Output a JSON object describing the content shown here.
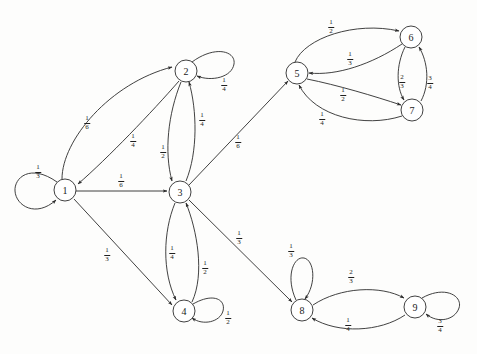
{
  "figure": {
    "type": "state-transition-diagram",
    "background_color": "#fdfdfc",
    "stroke_color": "#2b2b2b",
    "node_fill": "#ffffff",
    "width": 477,
    "height": 354
  },
  "nodes": [
    {
      "id": "1",
      "label": "1",
      "cx": 65,
      "cy": 190,
      "r": 11
    },
    {
      "id": "2",
      "label": "2",
      "cx": 186,
      "cy": 71,
      "r": 11
    },
    {
      "id": "3",
      "label": "3",
      "cx": 180,
      "cy": 192,
      "r": 11
    },
    {
      "id": "4",
      "label": "4",
      "cx": 184,
      "cy": 311,
      "r": 11
    },
    {
      "id": "5",
      "label": "5",
      "cx": 297,
      "cy": 73,
      "r": 11
    },
    {
      "id": "6",
      "label": "6",
      "cx": 411,
      "cy": 37,
      "r": 11
    },
    {
      "id": "7",
      "label": "7",
      "cx": 412,
      "cy": 110,
      "r": 11
    },
    {
      "id": "8",
      "label": "8",
      "cx": 302,
      "cy": 310,
      "r": 11
    },
    {
      "id": "9",
      "label": "9",
      "cx": 415,
      "cy": 307,
      "r": 11
    }
  ],
  "edges": [
    {
      "from": "1",
      "to": "1",
      "kind": "self-loop",
      "numerator": "1",
      "denominator": "3",
      "label_x": 38,
      "label_y": 172
    },
    {
      "from": "1",
      "to": "2",
      "kind": "curved",
      "numerator": "1",
      "denominator": "6",
      "label_x": 87,
      "label_y": 123
    },
    {
      "from": "2",
      "to": "1",
      "kind": "curved",
      "numerator": "1",
      "denominator": "4",
      "label_x": 133,
      "label_y": 141
    },
    {
      "from": "1",
      "to": "3",
      "kind": "straight",
      "numerator": "1",
      "denominator": "6",
      "label_x": 121,
      "label_y": 181
    },
    {
      "from": "1",
      "to": "4",
      "kind": "straight",
      "numerator": "1",
      "denominator": "3",
      "label_x": 107,
      "label_y": 255
    },
    {
      "from": "2",
      "to": "2",
      "kind": "self-loop",
      "numerator": "1",
      "denominator": "4",
      "label_x": 224,
      "label_y": 85
    },
    {
      "from": "2",
      "to": "3",
      "kind": "curved",
      "numerator": "1",
      "denominator": "2",
      "label_x": 163,
      "label_y": 152
    },
    {
      "from": "3",
      "to": "2",
      "kind": "curved",
      "numerator": "1",
      "denominator": "4",
      "label_x": 202,
      "label_y": 120
    },
    {
      "from": "3",
      "to": "4",
      "kind": "curved",
      "numerator": "1",
      "denominator": "4",
      "label_x": 172,
      "label_y": 253
    },
    {
      "from": "4",
      "to": "3",
      "kind": "curved",
      "numerator": "1",
      "denominator": "2",
      "label_x": 205,
      "label_y": 268
    },
    {
      "from": "4",
      "to": "4",
      "kind": "self-loop",
      "numerator": "1",
      "denominator": "2",
      "label_x": 228,
      "label_y": 318
    },
    {
      "from": "3",
      "to": "5",
      "kind": "straight",
      "numerator": "1",
      "denominator": "6",
      "label_x": 238,
      "label_y": 142
    },
    {
      "from": "3",
      "to": "8",
      "kind": "straight",
      "numerator": "1",
      "denominator": "3",
      "label_x": 239,
      "label_y": 238
    },
    {
      "from": "5",
      "to": "6",
      "kind": "curved",
      "numerator": "1",
      "denominator": "2",
      "label_x": 331,
      "label_y": 27
    },
    {
      "from": "6",
      "to": "5",
      "kind": "curved",
      "numerator": "1",
      "denominator": "3",
      "label_x": 350,
      "label_y": 59
    },
    {
      "from": "5",
      "to": "7",
      "kind": "curved",
      "numerator": "1",
      "denominator": "2",
      "label_x": 343,
      "label_y": 95
    },
    {
      "from": "7",
      "to": "5",
      "kind": "curved",
      "numerator": "1",
      "denominator": "4",
      "label_x": 322,
      "label_y": 119
    },
    {
      "from": "6",
      "to": "7",
      "kind": "curved",
      "numerator": "2",
      "denominator": "3",
      "label_x": 402,
      "label_y": 82
    },
    {
      "from": "7",
      "to": "6",
      "kind": "curved",
      "numerator": "3",
      "denominator": "4",
      "label_x": 430,
      "label_y": 83
    },
    {
      "from": "8",
      "to": "8",
      "kind": "self-loop",
      "numerator": "1",
      "denominator": "3",
      "label_x": 291,
      "label_y": 251
    },
    {
      "from": "8",
      "to": "9",
      "kind": "curved",
      "numerator": "2",
      "denominator": "3",
      "label_x": 351,
      "label_y": 277
    },
    {
      "from": "9",
      "to": "8",
      "kind": "curved",
      "numerator": "1",
      "denominator": "4",
      "label_x": 348,
      "label_y": 325
    },
    {
      "from": "9",
      "to": "9",
      "kind": "self-loop",
      "numerator": "3",
      "denominator": "4",
      "label_x": 440,
      "label_y": 326
    }
  ]
}
